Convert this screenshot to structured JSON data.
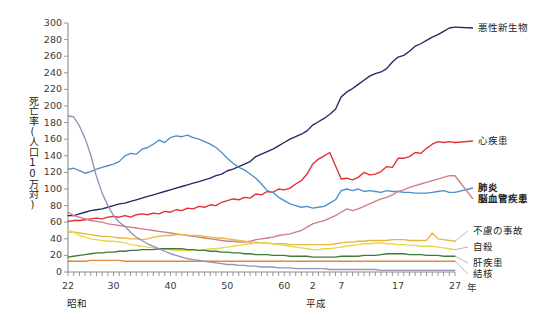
{
  "chart_data": {
    "type": "line",
    "title": "",
    "xlabel": "",
    "ylabel": "死亡率(人口10万対)",
    "ylim": [
      0,
      300
    ],
    "ytick_step": 20,
    "yticks": [
      0,
      20,
      40,
      60,
      80,
      100,
      120,
      140,
      160,
      180,
      200,
      220,
      240,
      260,
      280,
      300
    ],
    "grid": false,
    "legend_position": "right-inline",
    "xlim": [
      1947,
      2015
    ],
    "x_minor_tick_interval": 1,
    "eras": [
      {
        "name": "昭和",
        "label_x": 1948.5
      },
      {
        "name": "平成",
        "label_x": 1990.5
      }
    ],
    "unit_suffix": "年",
    "xticks": [
      {
        "x": 1947,
        "label": "22"
      },
      {
        "x": 1955,
        "label": "30"
      },
      {
        "x": 1965,
        "label": "40"
      },
      {
        "x": 1975,
        "label": "50"
      },
      {
        "x": 1985,
        "label": "60"
      },
      {
        "x": 1990,
        "label": "2"
      },
      {
        "x": 1995,
        "label": "7"
      },
      {
        "x": 2005,
        "label": "17"
      },
      {
        "x": 2015,
        "label": "27"
      }
    ],
    "x": [
      1947,
      1948,
      1949,
      1950,
      1951,
      1952,
      1953,
      1954,
      1955,
      1956,
      1957,
      1958,
      1959,
      1960,
      1961,
      1962,
      1963,
      1964,
      1965,
      1966,
      1967,
      1968,
      1969,
      1970,
      1971,
      1972,
      1973,
      1974,
      1975,
      1976,
      1977,
      1978,
      1979,
      1980,
      1981,
      1982,
      1983,
      1984,
      1985,
      1986,
      1987,
      1988,
      1989,
      1990,
      1991,
      1992,
      1993,
      1994,
      1995,
      1996,
      1997,
      1998,
      1999,
      2000,
      2001,
      2002,
      2003,
      2004,
      2005,
      2006,
      2007,
      2008,
      2009,
      2010,
      2011,
      2012,
      2013,
      2014,
      2015
    ],
    "series": [
      {
        "name": "悪性新生物",
        "color": "#1f2a63",
        "bold_label": false,
        "label_y_value": 300,
        "values": [
          68,
          68,
          70,
          72,
          74,
          75,
          76,
          78,
          80,
          82,
          83,
          85,
          87,
          89,
          91,
          93,
          95,
          97,
          99,
          101,
          103,
          105,
          107,
          109,
          111,
          113,
          116,
          118,
          122,
          124,
          127,
          130,
          133,
          139,
          142,
          145,
          148,
          152,
          156,
          160,
          163,
          166,
          170,
          177,
          181,
          185,
          190,
          196,
          211,
          217,
          221,
          226,
          231,
          236,
          239,
          241,
          245,
          253,
          259,
          261,
          266,
          272,
          275,
          279,
          283,
          286,
          290,
          294,
          295
        ]
      },
      {
        "name": "心疾患",
        "color": "#e03030",
        "bold_label": false,
        "label_y_value": 156,
        "values": [
          61,
          62,
          62,
          63,
          64,
          65,
          64,
          66,
          67,
          66,
          68,
          66,
          69,
          70,
          69,
          71,
          70,
          73,
          72,
          75,
          74,
          77,
          76,
          79,
          78,
          81,
          80,
          84,
          86,
          88,
          87,
          90,
          89,
          94,
          93,
          97,
          96,
          100,
          99,
          101,
          106,
          110,
          118,
          130,
          136,
          140,
          144,
          128,
          112,
          113,
          111,
          114,
          120,
          117,
          118,
          121,
          127,
          126,
          137,
          137,
          139,
          144,
          143,
          149,
          154,
          157,
          156,
          157,
          156
        ]
      },
      {
        "name": "肺炎",
        "color": "#4f8fc9",
        "bold_label": true,
        "label_y_value": 104,
        "values": [
          124,
          125,
          122,
          119,
          121,
          124,
          126,
          128,
          130,
          133,
          140,
          143,
          142,
          148,
          150,
          154,
          159,
          156,
          162,
          164,
          163,
          165,
          162,
          160,
          157,
          154,
          150,
          144,
          137,
          131,
          126,
          123,
          118,
          113,
          106,
          98,
          96,
          90,
          86,
          82,
          80,
          78,
          79,
          77,
          78,
          79,
          83,
          87,
          98,
          100,
          98,
          100,
          97,
          98,
          97,
          96,
          98,
          97,
          97,
          96,
          96,
          95,
          95,
          95,
          96,
          97,
          98,
          96,
          96
        ]
      },
      {
        "name": "脳血管疾患",
        "color": "#d07d8a",
        "bold_label": true,
        "label_y_value": 90,
        "values": [
          72,
          68,
          66,
          64,
          62,
          61,
          60,
          58,
          57,
          56,
          55,
          54,
          53,
          52,
          51,
          50,
          49,
          48,
          47,
          46,
          45,
          44,
          43,
          42,
          41,
          40,
          39,
          38,
          37,
          37,
          36,
          36,
          37,
          39,
          40,
          41,
          42,
          44,
          45,
          46,
          48,
          50,
          54,
          58,
          60,
          62,
          65,
          68,
          72,
          76,
          74,
          76,
          79,
          82,
          85,
          88,
          90,
          93,
          97,
          99,
          102,
          104,
          106,
          108,
          110,
          112,
          114,
          116,
          116
        ]
      },
      {
        "name": "不慮の事故",
        "color": "#e8b83c",
        "bold_label": false,
        "label_y_value": 52,
        "values": [
          48,
          48,
          47,
          46,
          45,
          44,
          43,
          43,
          42,
          41,
          41,
          40,
          40,
          39,
          40,
          42,
          43,
          44,
          44,
          45,
          45,
          44,
          44,
          44,
          43,
          42,
          41,
          41,
          40,
          39,
          38,
          37,
          36,
          36,
          35,
          35,
          34,
          34,
          34,
          33,
          33,
          33,
          33,
          33,
          33,
          33,
          33,
          34,
          35,
          36,
          36,
          37,
          37,
          38,
          38,
          38,
          38,
          39,
          39,
          39,
          38,
          38,
          38,
          38,
          47,
          40,
          39,
          38,
          37
        ]
      },
      {
        "name": "自殺",
        "color": "#e8d848",
        "bold_label": false,
        "label_y_value": 38,
        "values": [
          50,
          48,
          44,
          42,
          40,
          39,
          38,
          37,
          37,
          36,
          35,
          33,
          32,
          31,
          30,
          29,
          28,
          28,
          27,
          26,
          26,
          26,
          26,
          26,
          27,
          28,
          28,
          29,
          30,
          31,
          32,
          33,
          34,
          35,
          35,
          35,
          34,
          33,
          32,
          31,
          30,
          29,
          28,
          27,
          27,
          28,
          28,
          29,
          30,
          31,
          32,
          33,
          34,
          34,
          35,
          35,
          34,
          34,
          33,
          33,
          32,
          32,
          31,
          31,
          31,
          30,
          29,
          28,
          27
        ]
      },
      {
        "name": "肝疾患",
        "color": "#3f7a3c",
        "bold_label": false,
        "label_y_value": 24,
        "values": [
          18,
          19,
          20,
          21,
          22,
          23,
          23,
          24,
          24,
          25,
          25,
          26,
          26,
          27,
          27,
          27,
          28,
          28,
          28,
          28,
          28,
          27,
          27,
          26,
          26,
          25,
          25,
          24,
          24,
          23,
          23,
          22,
          22,
          21,
          21,
          21,
          20,
          20,
          20,
          19,
          19,
          19,
          19,
          18,
          18,
          18,
          18,
          18,
          19,
          19,
          19,
          19,
          20,
          20,
          20,
          21,
          22,
          22,
          22,
          22,
          21,
          21,
          21,
          20,
          20,
          20,
          19,
          19,
          19
        ]
      },
      {
        "name": "結核",
        "color": "#e08a3c",
        "bold_label": false,
        "label_y_value": 12,
        "values": [
          13,
          13,
          13,
          13,
          14,
          14,
          14,
          14,
          14,
          14,
          13,
          13,
          13,
          13,
          13,
          13,
          13,
          13,
          13,
          13,
          13,
          13,
          13,
          13,
          13,
          13,
          13,
          13,
          13,
          13,
          13,
          13,
          13,
          13,
          13,
          13,
          13,
          13,
          13,
          13,
          13,
          13,
          13,
          13,
          13,
          13,
          13,
          13,
          13,
          13,
          13,
          13,
          13,
          13,
          13,
          13,
          13,
          13,
          13,
          13,
          13,
          13,
          13,
          13,
          13,
          13,
          13,
          13,
          13
        ]
      },
      {
        "name": "結核(初期)",
        "color": "#9a8fb5",
        "bold_label": false,
        "hide_label": true,
        "values": [
          188,
          187,
          176,
          161,
          141,
          115,
          95,
          80,
          68,
          60,
          55,
          48,
          42,
          38,
          34,
          31,
          28,
          25,
          22,
          20,
          18,
          16,
          15,
          14,
          13,
          12,
          11,
          10,
          9,
          9,
          8,
          8,
          7,
          7,
          6,
          6,
          6,
          5,
          5,
          5,
          4,
          4,
          4,
          4,
          4,
          4,
          3,
          3,
          3,
          3,
          3,
          3,
          3,
          3,
          3,
          2,
          2,
          2,
          2,
          2,
          2,
          2,
          2,
          2,
          2,
          2,
          2,
          2,
          2
        ]
      }
    ],
    "label_annotations": [
      {
        "name": "悪性新生物",
        "x": 478,
        "y": 22,
        "bold": false
      },
      {
        "name": "心疾患",
        "x": 478,
        "y": 135,
        "bold": false
      },
      {
        "name": "肺炎",
        "x": 478,
        "y": 182,
        "bold": true
      },
      {
        "name": "脳血管疾患",
        "x": 478,
        "y": 193,
        "bold": true
      },
      {
        "name": "不慮の事故",
        "x": 473,
        "y": 225,
        "bold": false
      },
      {
        "name": "自殺",
        "x": 473,
        "y": 241,
        "bold": false
      },
      {
        "name": "肝疾患",
        "x": 473,
        "y": 257,
        "bold": false
      },
      {
        "name": "結核",
        "x": 473,
        "y": 268,
        "bold": false
      }
    ]
  }
}
